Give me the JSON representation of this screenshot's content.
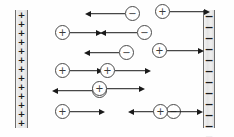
{
  "diagram": {
    "width": 234,
    "height": 137,
    "background_color": "#fefefe",
    "line_color": "#1a1a1a"
  },
  "plates": [
    {
      "id": "left-plate",
      "polarity": "positive",
      "sign": "+",
      "sign_count": 13,
      "x": 15,
      "y": 10,
      "width": 13,
      "height": 118,
      "fill_color": "#e4e4e4",
      "edge_color": "#6e6e6e"
    },
    {
      "id": "right-plate",
      "polarity": "negative",
      "sign": "−",
      "sign_count": 13,
      "x": 203,
      "y": 10,
      "width": 12,
      "height": 118,
      "fill_color": "#e4e4e4",
      "edge_color": "#6e6e6e"
    }
  ],
  "particles": [
    {
      "id": "p1",
      "sign": "−",
      "charge": "negative",
      "direction": "left",
      "x": 85,
      "y": 6,
      "arrow_length": 40
    },
    {
      "id": "p2",
      "sign": "+",
      "charge": "positive",
      "direction": "right",
      "x": 155,
      "y": 4,
      "arrow_length": 40
    },
    {
      "id": "p3",
      "sign": "+",
      "charge": "positive",
      "direction": "right",
      "x": 55,
      "y": 25,
      "arrow_length": 32
    },
    {
      "id": "p4",
      "sign": "−",
      "charge": "negative",
      "direction": "left",
      "x": 100,
      "y": 25,
      "arrow_length": 37
    },
    {
      "id": "p5",
      "sign": "−",
      "charge": "negative",
      "direction": "left",
      "x": 84,
      "y": 45,
      "arrow_length": 35
    },
    {
      "id": "p6",
      "sign": "+",
      "charge": "positive",
      "direction": "right",
      "x": 152,
      "y": 43,
      "arrow_length": 37
    },
    {
      "id": "p7",
      "sign": "+",
      "charge": "positive",
      "direction": "right",
      "x": 55,
      "y": 63,
      "arrow_length": 33
    },
    {
      "id": "p8",
      "sign": "+",
      "charge": "positive",
      "direction": "right",
      "x": 100,
      "y": 63,
      "arrow_length": 36
    },
    {
      "id": "p9",
      "sign": "−",
      "charge": "negative",
      "direction": "left",
      "x": 52,
      "y": 83,
      "arrow_length": 40
    },
    {
      "id": "p10",
      "sign": "+",
      "charge": "positive",
      "direction": "right",
      "x": 92,
      "y": 81,
      "arrow_length": 38
    },
    {
      "id": "p11",
      "sign": "+",
      "charge": "positive",
      "direction": "right",
      "x": 55,
      "y": 104,
      "arrow_length": 35
    },
    {
      "id": "p12",
      "sign": "−",
      "charge": "negative",
      "direction": "left",
      "x": 128,
      "y": 104,
      "arrow_length": 38
    },
    {
      "id": "p13",
      "sign": "+",
      "charge": "positive",
      "direction": "right",
      "x": 153,
      "y": 104,
      "arrow_length": 35
    }
  ]
}
